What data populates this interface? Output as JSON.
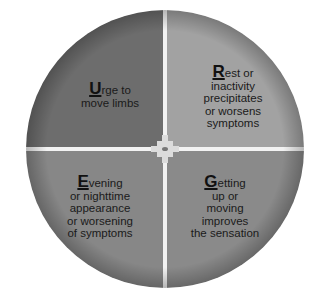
{
  "diagram": {
    "type": "quadrant-circle",
    "colors": {
      "background": "#ffffff",
      "gap": "#f2f2f2",
      "center_square": "#dcdcdc",
      "center_dot": "#777777",
      "top_left": "#6d6d6d",
      "top_right": "#a2a2a2",
      "bottom_left": "#878787",
      "bottom_right": "#8a8a8a",
      "text": "#1a1a1a"
    },
    "quadrants": [
      {
        "position": "top-left",
        "initial": "U",
        "rest_first_line": "rge to",
        "lines": [
          "move limbs"
        ]
      },
      {
        "position": "top-right",
        "initial": "R",
        "rest_first_line": "est or",
        "lines": [
          "inactivity",
          "precipitates",
          "or worsens",
          "symptoms"
        ]
      },
      {
        "position": "bottom-left",
        "initial": "E",
        "rest_first_line": "vening",
        "lines": [
          "or nighttime",
          "appearance",
          "or worsening",
          "of symptoms"
        ]
      },
      {
        "position": "bottom-right",
        "initial": "G",
        "rest_first_line": "etting",
        "lines": [
          "up or",
          "moving",
          "improves",
          "the sensation"
        ]
      }
    ]
  }
}
